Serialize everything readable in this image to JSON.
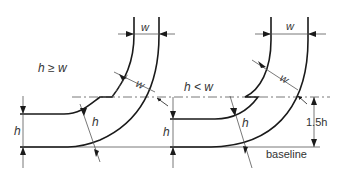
{
  "diagram": {
    "type": "technical-drawing",
    "colors": {
      "line": "#1a1a1a",
      "dim": "#555555",
      "text": "#333333",
      "background": "#ffffff"
    },
    "left_case": {
      "condition": "h ≥ w",
      "width_label_top": "w",
      "width_label_diag": "w",
      "height_label_side": "h",
      "height_label_diag": "h"
    },
    "right_case": {
      "condition": "h < w",
      "width_label_top": "w",
      "width_label_diag": "w",
      "height_label_side": "h",
      "height_label_diag": "h",
      "offset_label": "1.5h",
      "baseline_label": "baseline"
    }
  }
}
